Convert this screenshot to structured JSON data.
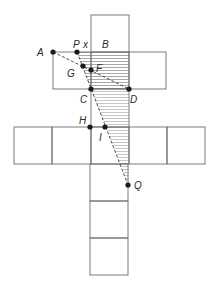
{
  "diagram": {
    "type": "cube net with shaded region and dashed construction lines",
    "labels": {
      "A": "A",
      "P": "P",
      "x": "x",
      "B": "B",
      "G": "G",
      "F": "F",
      "C": "C",
      "D": "D",
      "H": "H",
      "I": "I",
      "Q": "Q"
    },
    "colors": {
      "grid": "#6f6f6f",
      "hatch": "#8a8a8a",
      "points": "#1a1a1a",
      "text": "#2a2a2a"
    }
  }
}
